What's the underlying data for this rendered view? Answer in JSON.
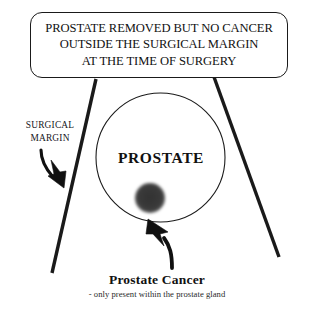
{
  "figure": {
    "title_box": {
      "lines": [
        "PROSTATE REMOVED BUT NO CANCER",
        "OUTSIDE THE SURGICAL MARGIN",
        "AT THE TIME OF SURGERY"
      ]
    },
    "labels": {
      "surgical_margin_line1": "SURGICAL",
      "surgical_margin_line2": "MARGIN",
      "prostate": "PROSTATE"
    },
    "caption": {
      "heading": "Prostate Cancer",
      "subtext": "- only present within the prostate gland"
    },
    "colors": {
      "ink": "#111111",
      "tumor": "#3a3a3a",
      "background": "#ffffff",
      "margin_line": "#1a1a1a"
    },
    "icons": {
      "margin_arrow": "arrow-down-right-icon",
      "cancer_arrow": "curved-arrow-up-left-icon",
      "prostate_outline": "circle-outline-icon",
      "tumor_blob": "filled-blob-icon"
    }
  }
}
